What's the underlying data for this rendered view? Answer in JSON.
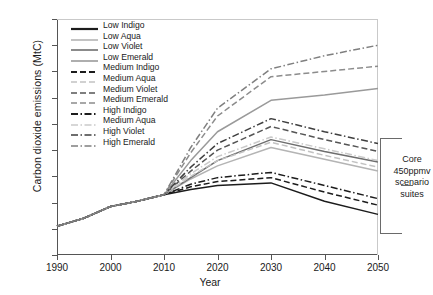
{
  "chart_data": {
    "type": "line",
    "title": "",
    "xlabel": "Year",
    "ylabel": "Carbon dioxide emissions (MtC)",
    "xlim": [
      1990,
      2050
    ],
    "ylim": [
      0,
      180
    ],
    "xticks": [
      1990,
      2000,
      2010,
      2020,
      2030,
      2040,
      2050
    ],
    "yticks": [
      0,
      20,
      40,
      60,
      80,
      100,
      120,
      140,
      160,
      180
    ],
    "grid": false,
    "legend_position": "upper-left-inside",
    "annotations": [
      {
        "text": "Core 450ppmv scenario suites",
        "kind": "bracket-right"
      }
    ],
    "x": [
      1990,
      1995,
      2000,
      2005,
      2010,
      2015,
      2020,
      2030,
      2040,
      2050
    ],
    "series": [
      {
        "name": "Low Indigo",
        "style": "solid",
        "color": "#1c1c1c",
        "values": [
          22,
          28,
          37,
          41,
          46,
          50,
          53,
          55,
          41,
          31
        ]
      },
      {
        "name": "Low Aqua",
        "style": "solid",
        "color": "#b4b4b4",
        "values": [
          22,
          28,
          37,
          41,
          46,
          58,
          68,
          82,
          73,
          64
        ]
      },
      {
        "name": "Low Violet",
        "style": "solid",
        "color": "#6e6e6e",
        "values": [
          22,
          28,
          37,
          41,
          46,
          59,
          72,
          88,
          79,
          71
        ]
      },
      {
        "name": "Low Emerald",
        "style": "solid",
        "color": "#9a9a9a",
        "values": [
          22,
          28,
          37,
          41,
          46,
          72,
          94,
          118,
          122,
          127
        ]
      },
      {
        "name": "Medium Indigo",
        "style": "dashed",
        "color": "#1c1c1c",
        "values": [
          22,
          28,
          37,
          41,
          46,
          52,
          56,
          59,
          48,
          38
        ]
      },
      {
        "name": "Medium Aqua",
        "style": "dashed",
        "color": "#c2c2c2",
        "values": [
          22,
          28,
          37,
          41,
          46,
          60,
          72,
          86,
          76,
          67
        ]
      },
      {
        "name": "Medium Violet",
        "style": "dashed",
        "color": "#555555",
        "values": [
          22,
          28,
          37,
          41,
          46,
          64,
          80,
          98,
          88,
          79
        ]
      },
      {
        "name": "Medium Emerald",
        "style": "dashed",
        "color": "#8c8c8c",
        "values": [
          22,
          28,
          37,
          41,
          46,
          78,
          106,
          136,
          140,
          144
        ]
      },
      {
        "name": "High Indigo",
        "style": "dashdot",
        "color": "#1c1c1c",
        "values": [
          22,
          28,
          37,
          41,
          46,
          54,
          59,
          63,
          53,
          43
        ]
      },
      {
        "name": "Medium Aqua",
        "style": "dashdot",
        "color": "#cacaca",
        "values": [
          22,
          28,
          37,
          41,
          46,
          62,
          75,
          90,
          81,
          72
        ]
      },
      {
        "name": "High Violet",
        "style": "dashdot",
        "color": "#3f3f3f",
        "values": [
          22,
          28,
          37,
          41,
          46,
          67,
          85,
          104,
          94,
          85
        ]
      },
      {
        "name": "High Emerald",
        "style": "dashdot",
        "color": "#7f7f7f",
        "values": [
          22,
          28,
          37,
          41,
          46,
          82,
          112,
          142,
          152,
          160
        ]
      }
    ]
  }
}
